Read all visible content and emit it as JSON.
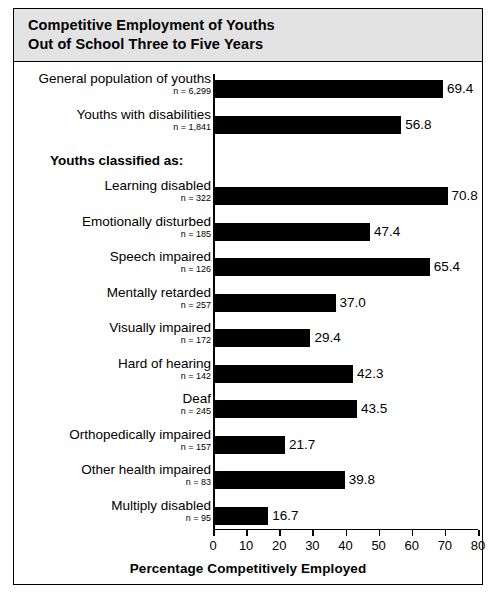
{
  "figure": {
    "title_line1": "Competitive Employment of Youths",
    "title_line2": "Out of School Three to Five Years",
    "group_header": "Youths classified as:"
  },
  "chart_data": {
    "type": "bar",
    "orientation": "horizontal",
    "title": "Competitive Employment of Youths Out of School Three to Five Years",
    "xlabel": "Percentage Competitively Employed",
    "ylabel": "",
    "xlim": [
      0,
      80
    ],
    "xticks": [
      0,
      10,
      20,
      30,
      40,
      50,
      60,
      70,
      80
    ],
    "grid": false,
    "legend": null,
    "bar_color": "#000000",
    "categories": [
      "General population of youths",
      "Youths with disabilities",
      "Learning disabled",
      "Emotionally disturbed",
      "Speech impaired",
      "Mentally retarded",
      "Visually impaired",
      "Hard of hearing",
      "Deaf",
      "Orthopedically impaired",
      "Other health impaired",
      "Multiply disabled"
    ],
    "values": [
      69.4,
      56.8,
      70.8,
      47.4,
      65.4,
      37.0,
      29.4,
      42.3,
      43.5,
      21.7,
      39.8,
      16.7
    ],
    "sample_sizes": [
      "n = 6,299",
      "n = 1,841",
      "n = 322",
      "n = 185",
      "n = 126",
      "n = 257",
      "n = 172",
      "n = 142",
      "n = 245",
      "n = 157",
      "n = 83",
      "n = 95"
    ],
    "value_labels": [
      "69.4",
      "56.8",
      "70.8",
      "47.4",
      "65.4",
      "37.0",
      "29.4",
      "42.3",
      "43.5",
      "21.7",
      "39.8",
      "16.7"
    ],
    "group_header": "Youths classified as:",
    "group_header_after_index": 1
  }
}
